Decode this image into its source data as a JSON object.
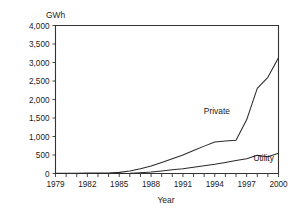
{
  "chart_data": {
    "type": "line",
    "title": "",
    "xlabel": "Year",
    "ylabel": "GWh",
    "unit_label": "GWh",
    "xlim": [
      1979,
      2000
    ],
    "ylim": [
      0,
      4000
    ],
    "grid": false,
    "legend_position": "inline-annotations",
    "x": [
      1979,
      1980,
      1981,
      1982,
      1983,
      1984,
      1985,
      1986,
      1987,
      1988,
      1989,
      1990,
      1991,
      1992,
      1993,
      1994,
      1995,
      1996,
      1997,
      1998,
      1999,
      2000
    ],
    "xticks": [
      1979,
      1980,
      1981,
      1982,
      1983,
      1984,
      1985,
      1986,
      1987,
      1988,
      1989,
      1990,
      1991,
      1992,
      1993,
      1994,
      1995,
      1996,
      1997,
      1998,
      1999,
      2000
    ],
    "xtick_labels": [
      "1979",
      "",
      "",
      "1982",
      "",
      "",
      "1985",
      "",
      "",
      "1988",
      "",
      "",
      "1991",
      "",
      "",
      "1994",
      "",
      "",
      "1997",
      "",
      "",
      "2000"
    ],
    "yticks": [
      0,
      500,
      1000,
      1500,
      2000,
      2500,
      3000,
      3500,
      4000
    ],
    "ytick_labels": [
      "0",
      "500",
      "1,000",
      "1,500",
      "2,000",
      "2,500",
      "3,000",
      "3,500",
      "4,000"
    ],
    "series": [
      {
        "name": "Private",
        "label": "Private",
        "color": "#2a2a2a",
        "values": [
          5,
          6,
          8,
          10,
          12,
          15,
          30,
          70,
          130,
          200,
          300,
          400,
          500,
          620,
          740,
          850,
          880,
          900,
          1450,
          2300,
          2600,
          3130
        ]
      },
      {
        "name": "Utility",
        "label": "Utility",
        "color": "#2a2a2a",
        "values": [
          0,
          0,
          0,
          0,
          0,
          0,
          2,
          5,
          20,
          40,
          70,
          100,
          130,
          170,
          210,
          250,
          300,
          350,
          400,
          490,
          450,
          550
        ]
      }
    ],
    "annotations": [
      {
        "text": "Private",
        "x": 1994.2,
        "y": 1620
      },
      {
        "text": "Utility",
        "x": 1998.6,
        "y": 330
      }
    ]
  }
}
